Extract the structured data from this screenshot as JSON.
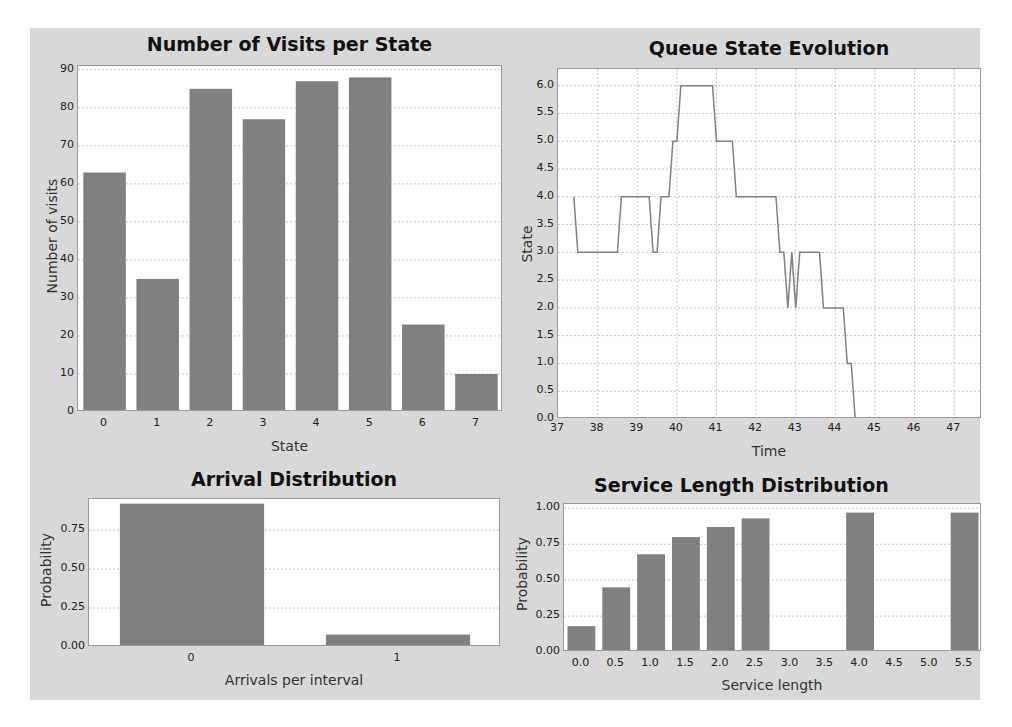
{
  "colors": {
    "panel_bg": "#d8d8d8",
    "plot_bg": "#ffffff",
    "bar": "#808080",
    "line": "#808080",
    "grid": "#c8c8c8"
  },
  "chart_data": [
    {
      "id": "visits",
      "type": "bar",
      "title": "Number of Visits per State",
      "xlabel": "State",
      "ylabel": "Number of visits",
      "categories": [
        "0",
        "1",
        "2",
        "3",
        "4",
        "5",
        "6",
        "7"
      ],
      "values": [
        63,
        35,
        85,
        77,
        87,
        88,
        23,
        10
      ],
      "ylim": [
        0,
        91
      ],
      "yticks": [
        0,
        10,
        20,
        30,
        40,
        50,
        60,
        70,
        80,
        90
      ],
      "grid": true,
      "legend": null
    },
    {
      "id": "queue",
      "type": "line",
      "title": "Queue State Evolution",
      "xlabel": "Time",
      "ylabel": "State",
      "xlim": [
        37,
        47.7
      ],
      "ylim": [
        0,
        6.3
      ],
      "xticks": [
        37,
        38,
        39,
        40,
        41,
        42,
        43,
        44,
        45,
        46,
        47
      ],
      "yticks": [
        "0.0",
        "0.5",
        "1.0",
        "1.5",
        "2.0",
        "2.5",
        "3.0",
        "3.5",
        "4.0",
        "4.5",
        "5.0",
        "5.5",
        "6.0"
      ],
      "x": [
        37.4,
        37.5,
        37.6,
        38.5,
        38.6,
        39.3,
        39.4,
        39.5,
        39.6,
        39.8,
        39.9,
        40.0,
        40.1,
        40.9,
        41.0,
        41.4,
        41.5,
        42.5,
        42.6,
        42.7,
        42.8,
        42.9,
        43.0,
        43.1,
        43.6,
        43.7,
        44.2,
        44.3,
        44.4,
        44.5
      ],
      "y": [
        4,
        3,
        3,
        3,
        4,
        4,
        3,
        3,
        4,
        4,
        5,
        5,
        6,
        6,
        5,
        5,
        4,
        4,
        3,
        3,
        2,
        3,
        2,
        3,
        3,
        2,
        2,
        1,
        1,
        0
      ],
      "grid": true,
      "legend": null
    },
    {
      "id": "arrival",
      "type": "bar",
      "title": "Arrival Distribution",
      "xlabel": "Arrivals per interval",
      "ylabel": "Probability",
      "categories": [
        "0",
        "1"
      ],
      "values": [
        0.92,
        0.08
      ],
      "ylim": [
        0,
        0.95
      ],
      "yticks": [
        "0.00",
        "0.25",
        "0.50",
        "0.75"
      ],
      "grid": true,
      "legend": null
    },
    {
      "id": "service",
      "type": "bar",
      "title": "Service Length Distribution",
      "xlabel": "Service length",
      "ylabel": "Probability",
      "categories": [
        "0.0",
        "0.5",
        "1.0",
        "1.5",
        "2.0",
        "2.5",
        "3.0",
        "3.5",
        "4.0",
        "4.5",
        "5.0",
        "5.5"
      ],
      "values": [
        0.18,
        0.45,
        0.68,
        0.8,
        0.87,
        0.93,
        0,
        0,
        0.97,
        0,
        0,
        0.97
      ],
      "ylim": [
        0,
        1.03
      ],
      "yticks": [
        "0.00",
        "0.25",
        "0.50",
        "0.75",
        "1.00"
      ],
      "grid": true,
      "legend": null
    }
  ]
}
